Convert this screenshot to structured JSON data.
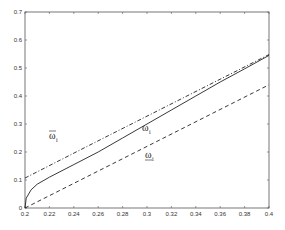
{
  "chart_data": {
    "type": "line",
    "title": "",
    "xlabel": "",
    "ylabel": "",
    "xlim": [
      0.2,
      0.4
    ],
    "ylim": [
      0,
      0.7
    ],
    "grid": false,
    "legend": "none (inline curve labels)",
    "x_ticks": [
      "0.2",
      "0.22",
      "0.24",
      "0.26",
      "0.28",
      "0.3",
      "0.32",
      "0.34",
      "0.36",
      "0.38",
      "0.4"
    ],
    "y_ticks": [
      "0",
      "0.1",
      "0.2",
      "0.3",
      "0.4",
      "0.5",
      "0.6",
      "0.7"
    ],
    "series": [
      {
        "name": "omega-bar_i (upper bound)",
        "label": "ω",
        "label_decoration": "overline",
        "label_subscript": "i",
        "style": "dash-dot",
        "x": [
          0.2,
          0.25,
          0.3,
          0.35,
          0.4
        ],
        "values": [
          0.107,
          0.218,
          0.328,
          0.438,
          0.548
        ]
      },
      {
        "name": "omega_i",
        "label": "ω",
        "label_decoration": "none",
        "label_subscript": "i",
        "style": "solid",
        "x": [
          0.2,
          0.201,
          0.205,
          0.21,
          0.22,
          0.24,
          0.26,
          0.28,
          0.3,
          0.32,
          0.34,
          0.36,
          0.38,
          0.4
        ],
        "values": [
          0.0,
          0.035,
          0.065,
          0.085,
          0.11,
          0.155,
          0.2,
          0.25,
          0.3,
          0.35,
          0.4,
          0.45,
          0.497,
          0.545
        ]
      },
      {
        "name": "omega-underbar_i (lower bound)",
        "label": "ω",
        "label_decoration": "underline",
        "label_subscript": "i",
        "style": "dashed",
        "x": [
          0.2,
          0.25,
          0.3,
          0.35,
          0.4
        ],
        "values": [
          0.0,
          0.11,
          0.22,
          0.33,
          0.44
        ]
      }
    ],
    "annotations": [
      {
        "text": "ω̄_i",
        "near": [
          0.23,
          0.25
        ]
      },
      {
        "text": "ω_i",
        "near": [
          0.297,
          0.28
        ]
      },
      {
        "text": "ω̲_i",
        "near": [
          0.3,
          0.19
        ]
      }
    ]
  }
}
